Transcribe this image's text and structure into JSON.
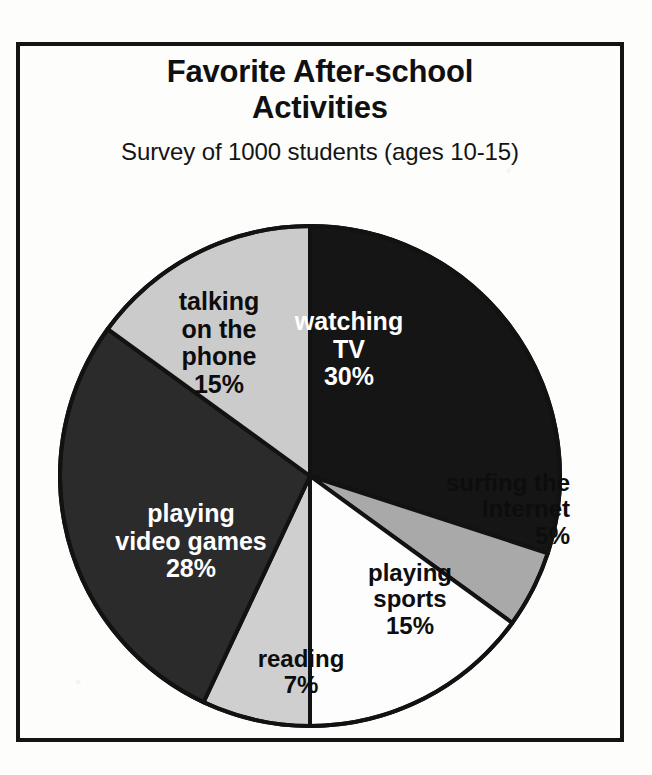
{
  "chart_data": {
    "type": "pie",
    "title": "Favorite After-school Activities",
    "title_line1": "Favorite After-school",
    "title_line2": "Activities",
    "subtitle": "Survey of 1000 students (ages 10-15)",
    "total_respondents": 1000,
    "units": "percent",
    "start_angle_deg": 0,
    "direction": "clockwise",
    "legend": "none (labels drawn inside slices)",
    "categories": [
      "watching TV",
      "surfing the Internet",
      "playing sports",
      "reading",
      "playing video games",
      "talking on the phone"
    ],
    "values": [
      30,
      5,
      15,
      7,
      28,
      15
    ],
    "slices": [
      {
        "label": "watching TV",
        "label_line1": "watching",
        "label_line2": "TV",
        "value": 30,
        "value_text": "30%",
        "fill": "#151515",
        "text_color": "#ffffff",
        "start_deg": 0,
        "end_deg": 108
      },
      {
        "label": "surfing the Internet",
        "label_line1": "surfing the",
        "label_line2": "Internet",
        "value": 5,
        "value_text": "5%",
        "fill": "#a9a9a9",
        "text_color": "#0d0d0d",
        "start_deg": 108,
        "end_deg": 126
      },
      {
        "label": "playing sports",
        "label_line1": "playing",
        "label_line2": "sports",
        "value": 15,
        "value_text": "15%",
        "fill": "#fdfdfd",
        "text_color": "#0d0d0d",
        "start_deg": 126,
        "end_deg": 180
      },
      {
        "label": "reading",
        "label_line1": "reading",
        "label_line2": "",
        "value": 7,
        "value_text": "7%",
        "fill": "#cfcfcf",
        "text_color": "#0d0d0d",
        "start_deg": 180,
        "end_deg": 205.2
      },
      {
        "label": "playing video games",
        "label_line1": "playing",
        "label_line2": "video games",
        "value": 28,
        "value_text": "28%",
        "fill": "#2b2b2b",
        "text_color": "#ffffff",
        "start_deg": 205.2,
        "end_deg": 306
      },
      {
        "label": "talking on the phone",
        "label_line1": "talking",
        "label_line2": "on the",
        "label_line3": "phone",
        "value": 15,
        "value_text": "15%",
        "fill": "#cbcbcb",
        "text_color": "#0d0d0d",
        "start_deg": 306,
        "end_deg": 360
      }
    ],
    "stroke_color": "#121212",
    "background": "#fdfdfc"
  }
}
